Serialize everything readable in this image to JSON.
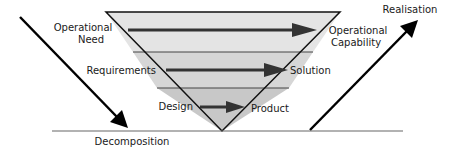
{
  "diagram": {
    "levels": [
      {
        "left": [
          "Operational",
          "Need"
        ],
        "right": [
          "Operational",
          "Capability"
        ],
        "fill": "#e4e4e4"
      },
      {
        "left": [
          "Requirements"
        ],
        "right": [
          "Solution"
        ],
        "fill": "#d6d6d6"
      },
      {
        "left": [
          "Design"
        ],
        "right": [
          "Product"
        ],
        "fill": "#c8c8c8"
      }
    ],
    "left_axis_label": "Decomposition",
    "right_axis_label": "Realisation",
    "colors": {
      "outline": "#111111",
      "level_arrow": "#333333",
      "divider": "#444444",
      "baseline": "#666666",
      "axis_arrow": "#000000"
    }
  }
}
